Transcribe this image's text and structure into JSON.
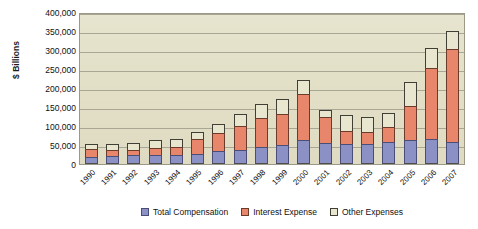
{
  "chart_data": {
    "type": "bar",
    "title": "",
    "subtitle": "",
    "xlabel": "",
    "ylabel": "$ Billions",
    "stacked": true,
    "grid": true,
    "legend_position": "bottom",
    "ylim": [
      0,
      400000
    ],
    "yticks": [
      400000,
      350000,
      300000,
      250000,
      200000,
      150000,
      100000,
      50000,
      0
    ],
    "ytick_labels": [
      "400,000",
      "350,000",
      "300,000",
      "250,000",
      "200,000",
      "150,000",
      "100,000",
      "50,000",
      "0"
    ],
    "categories": [
      "1990",
      "1991",
      "1992",
      "1993",
      "1994",
      "1995",
      "1996",
      "1997",
      "1998",
      "1999",
      "2000",
      "2001",
      "2002",
      "2003",
      "2004",
      "2005",
      "2006",
      "2007"
    ],
    "series": [
      {
        "name": "Total Compensation",
        "color": "#8b91c5",
        "values": [
          18000,
          21000,
          23000,
          24000,
          24000,
          26000,
          33000,
          38000,
          46000,
          50000,
          63000,
          55000,
          52000,
          53000,
          57000,
          62000,
          66000,
          58000
        ]
      },
      {
        "name": "Interest Expense",
        "color": "#e8866c",
        "values": [
          22000,
          16000,
          14000,
          17000,
          21000,
          40000,
          48000,
          63000,
          76000,
          82000,
          122000,
          68000,
          36000,
          32000,
          41000,
          92000,
          186000,
          246000
        ]
      },
      {
        "name": "Other Expenses",
        "color": "#e9e6d0",
        "values": [
          12000,
          16000,
          18000,
          22000,
          22000,
          19000,
          24000,
          30000,
          37000,
          38000,
          36000,
          20000,
          42000,
          38000,
          35000,
          62000,
          54000,
          46000
        ]
      }
    ]
  },
  "legend": {
    "items": [
      {
        "label": "Total Compensation"
      },
      {
        "label": "Interest Expense"
      },
      {
        "label": "Other Expenses"
      }
    ]
  }
}
